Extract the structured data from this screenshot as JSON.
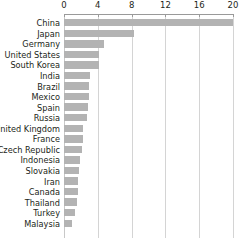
{
  "chart_data": {
    "type": "bar",
    "orientation": "horizontal",
    "title": "",
    "subtitle": "",
    "xlabel": "",
    "ylabel": "",
    "xlim": [
      0,
      20
    ],
    "xticks": [
      0,
      4,
      8,
      12,
      16,
      20
    ],
    "xtick_labels": [
      "0",
      "4",
      "8",
      "12",
      "16",
      "20"
    ],
    "grid": true,
    "grid_axis": "x",
    "legend": false,
    "bar_color": "#b3b3b3",
    "gridline_color": "#d4d4d4",
    "axis_color": "#9a9a9a",
    "text_color": "#231f20",
    "categories": [
      "China",
      "Japan",
      "Germany",
      "United States",
      "South Korea",
      "India",
      "Brazil",
      "Mexico",
      "Spain",
      "Russia",
      "United Kingdom",
      "France",
      "Czech Republic",
      "Indonesia",
      "Slovakia",
      "Iran",
      "Canada",
      "Thailand",
      "Turkey",
      "Malaysia"
    ],
    "values": [
      20.0,
      8.3,
      4.7,
      4.1,
      4.1,
      3.1,
      2.9,
      2.9,
      2.8,
      2.7,
      2.3,
      2.3,
      2.1,
      1.9,
      1.8,
      1.7,
      1.6,
      1.5,
      1.3,
      0.9
    ]
  }
}
